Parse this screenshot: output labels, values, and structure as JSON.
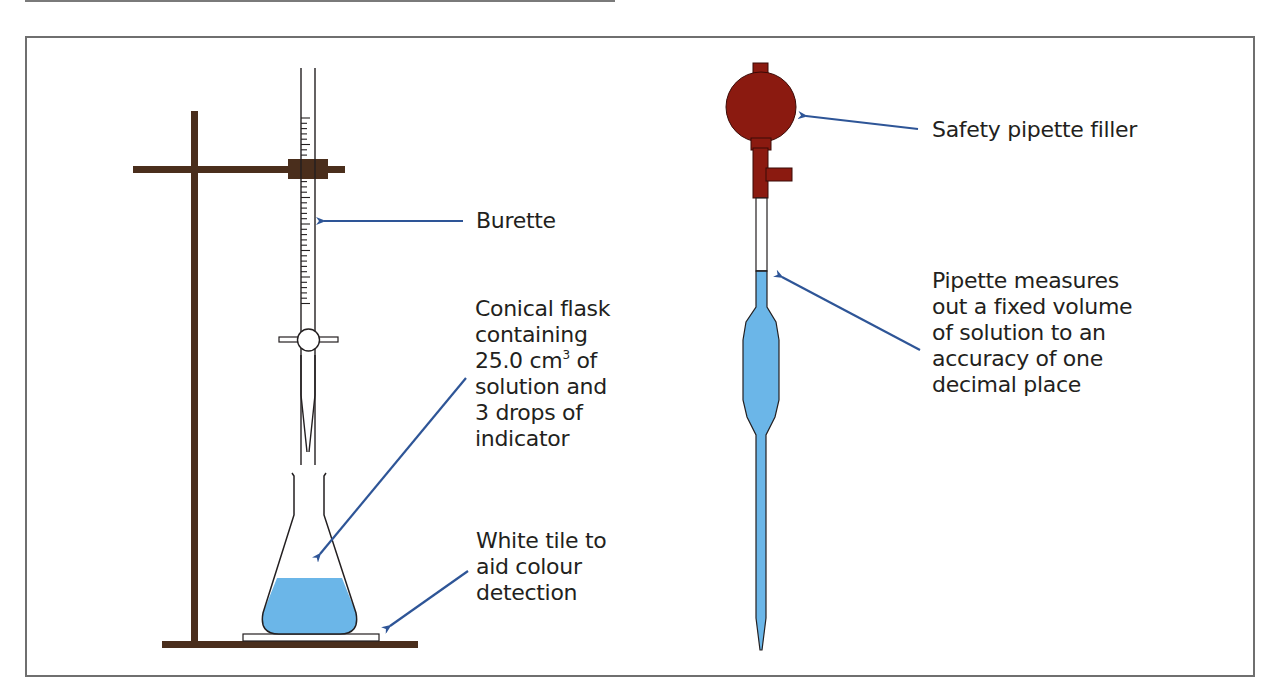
{
  "figure": {
    "colors": {
      "stand": "#4a2e1c",
      "filler": "#8b1a10",
      "liquid": "#6bb6e8",
      "arrow": "#2e5597",
      "outline": "#231f20",
      "frame": "#6f6f6f"
    }
  },
  "labels": {
    "burette": "Burette",
    "flask": {
      "line1": "Conical flask",
      "line2": "containing",
      "line3_pre": "25.0 cm",
      "line3_sup": "3",
      "line3_post": " of",
      "line4": "solution and",
      "line5": "3 drops of",
      "line6": "indicator"
    },
    "tile": {
      "line1": "White tile to",
      "line2": "aid colour",
      "line3": "detection"
    },
    "filler": "Safety pipette filler",
    "pipette": {
      "line1": "Pipette measures",
      "line2": "out a fixed volume",
      "line3": "of solution to an",
      "line4": "accuracy of one",
      "line5": "decimal place"
    }
  }
}
